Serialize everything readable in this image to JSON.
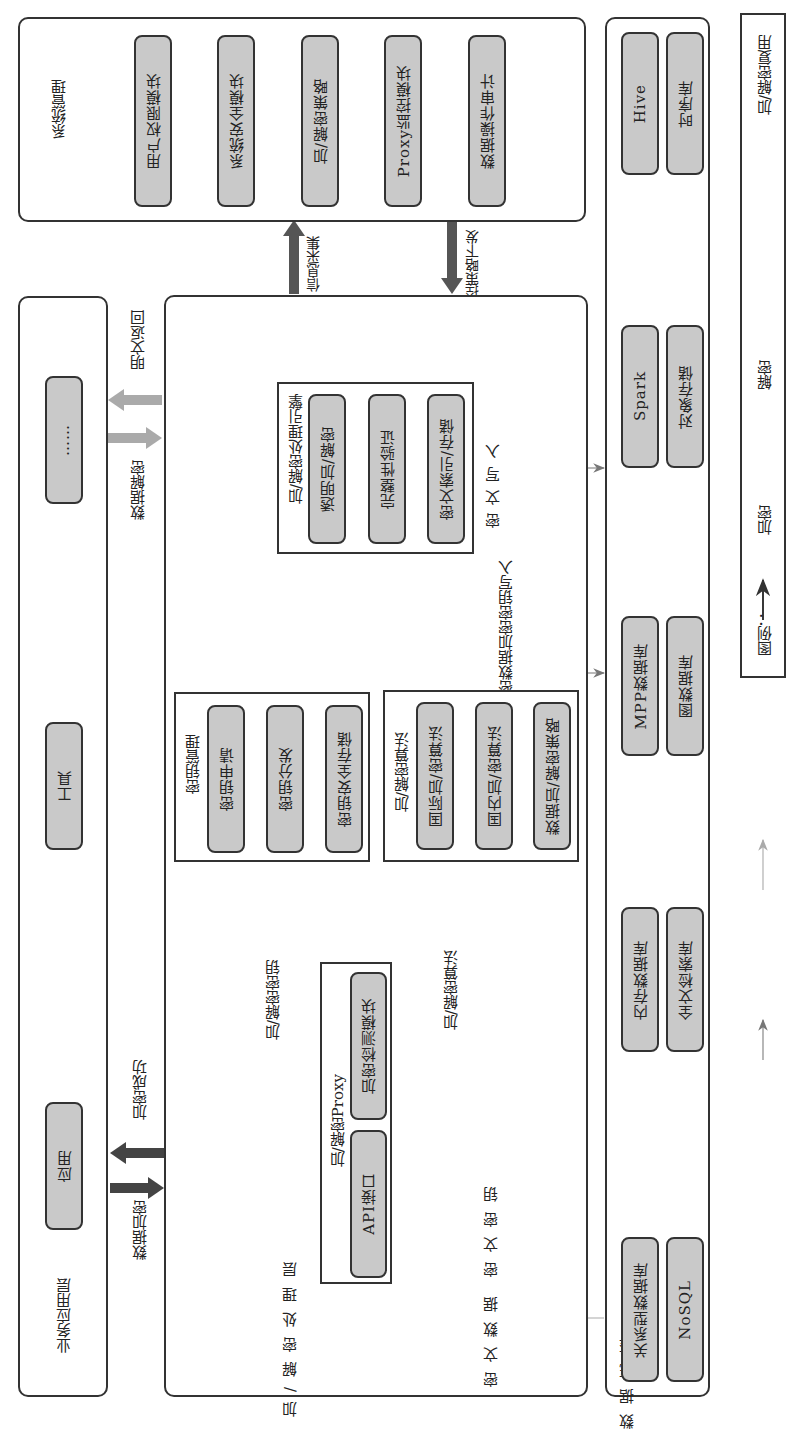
{
  "system_management": {
    "title": "系统管理",
    "modules": [
      "用户权限模块",
      "系统安全模块",
      "加/解密策略",
      "Proxy监控模块",
      "数据操作审计"
    ]
  },
  "business_layer": {
    "title": "业务应用层",
    "items": [
      "应用",
      "工具",
      "……"
    ]
  },
  "processing_layer": {
    "title": "加/解密处理层",
    "engine": {
      "title": "加/解密处理引擎",
      "steps": [
        "透明加/解密",
        "完整性验证",
        "密文索引/存储"
      ]
    },
    "key_management": {
      "title": "密钥管理",
      "steps": [
        "密钥申请",
        "密钥分发",
        "密钥安全存储"
      ]
    },
    "algorithms": {
      "title": "加/解密算法",
      "steps": [
        "国际加/密算法",
        "国内加/密算法",
        "数据加/解密策略"
      ]
    },
    "proxy": {
      "title": "加/解密Proxy",
      "modules": [
        "API接口",
        "加密检测模块"
      ]
    },
    "labels": {
      "cipher_data": "密文数据",
      "cipher_key": "密文密钥"
    }
  },
  "data_base": {
    "title": "数据底座",
    "stores": [
      [
        "关系型数据库",
        "NoSQL"
      ],
      [
        "内存数据库",
        "全文检索库"
      ],
      [
        "MPP数据库",
        "图数据库"
      ],
      [
        "Spark",
        "对象存储"
      ],
      [
        "Hive",
        "时序库"
      ]
    ]
  },
  "flow_labels": {
    "info_collect": "信息采集",
    "policy_dispatch": "管控策略下发",
    "plaintext_return": "明文返回",
    "data_decrypt": "数据解密",
    "encrypt_success": "加密成功",
    "data_encrypt": "数据加密",
    "crypto_key": "加/解密密钥",
    "crypto_algorithm": "加/解密算法",
    "cipher_write": "密文写入",
    "key_write": "加密数据加密密钥写入"
  },
  "legend": {
    "title": "图例：",
    "items": [
      {
        "label": "加密",
        "color": "#888888"
      },
      {
        "label": "解密",
        "color": "#b0b0b0"
      },
      {
        "label": "加/解密复用",
        "color": "#222222"
      }
    ]
  }
}
